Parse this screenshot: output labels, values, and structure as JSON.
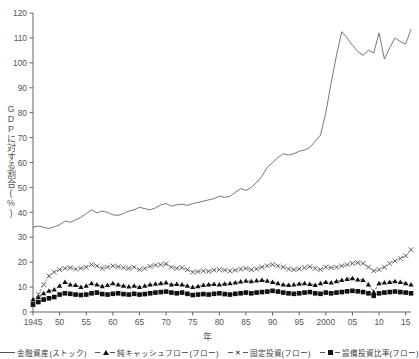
{
  "chart_data": {
    "type": "line",
    "title": "",
    "xlabel": "年",
    "ylabel": "GDPに対する割合(%)",
    "xlim": [
      1945,
      2016
    ],
    "ylim": [
      0,
      120
    ],
    "ytick_step": 10,
    "yticks": [
      0,
      10,
      20,
      30,
      40,
      50,
      60,
      70,
      80,
      90,
      100,
      110,
      120
    ],
    "xticks": [
      1945,
      1950,
      1955,
      1960,
      1965,
      1970,
      1975,
      1980,
      1985,
      1990,
      1995,
      2000,
      2005,
      2010,
      2015
    ],
    "xtick_labels": [
      "1945",
      "50",
      "55",
      "60",
      "65",
      "70",
      "75",
      "80",
      "85",
      "90",
      "95",
      "2000",
      "05",
      "10",
      "15"
    ],
    "grid": false,
    "legend_position": "bottom",
    "x": [
      1945,
      1946,
      1947,
      1948,
      1949,
      1950,
      1951,
      1952,
      1953,
      1954,
      1955,
      1956,
      1957,
      1958,
      1959,
      1960,
      1961,
      1962,
      1963,
      1964,
      1965,
      1966,
      1967,
      1968,
      1969,
      1970,
      1971,
      1972,
      1973,
      1974,
      1975,
      1976,
      1977,
      1978,
      1979,
      1980,
      1981,
      1982,
      1983,
      1984,
      1985,
      1986,
      1987,
      1988,
      1989,
      1990,
      1991,
      1992,
      1993,
      1994,
      1995,
      1996,
      1997,
      1998,
      1999,
      2000,
      2001,
      2002,
      2003,
      2004,
      2005,
      2006,
      2007,
      2008,
      2009,
      2010,
      2011,
      2012,
      2013,
      2014,
      2015,
      2016
    ],
    "series": [
      {
        "name": "金融資産(ストック)",
        "label": "金融資産(ストック)",
        "marker": "none",
        "linestyle": "solid",
        "color": "#555555",
        "values": [
          34.0,
          34.5,
          34.0,
          33.5,
          34.2,
          35.0,
          36.5,
          36.0,
          37.0,
          38.0,
          39.5,
          41.0,
          39.8,
          40.5,
          40.0,
          39.0,
          38.8,
          39.5,
          40.5,
          41.0,
          42.0,
          41.5,
          41.0,
          41.8,
          43.0,
          43.5,
          42.5,
          43.0,
          43.3,
          42.8,
          43.5,
          44.0,
          44.5,
          45.0,
          45.5,
          46.5,
          46.0,
          46.5,
          48.0,
          49.5,
          48.8,
          50.0,
          52.0,
          54.5,
          58.0,
          60.0,
          62.0,
          63.5,
          63.0,
          63.5,
          64.5,
          65.0,
          66.0,
          68.5,
          71.0,
          80.0,
          92.0,
          103.0,
          112.5,
          110.0,
          107.0,
          104.5,
          103.0,
          105.0,
          104.0,
          112.0,
          101.5,
          106.0,
          110.0,
          108.5,
          107.5,
          113.5
        ]
      },
      {
        "name": "純キャッシュフロー(フロー)",
        "label": "純キャッシュフロー(フロー)",
        "marker": "triangle",
        "linestyle": "dashed",
        "color": "#111111",
        "values": [
          5.0,
          6.0,
          7.5,
          8.5,
          9.0,
          10.5,
          12.0,
          11.0,
          10.8,
          10.0,
          10.5,
          11.5,
          11.0,
          10.3,
          10.8,
          11.5,
          11.0,
          10.5,
          10.2,
          10.5,
          10.0,
          10.5,
          11.0,
          11.3,
          11.5,
          11.8,
          11.0,
          11.2,
          11.0,
          10.5,
          10.0,
          10.3,
          10.8,
          11.0,
          11.2,
          11.0,
          11.3,
          11.5,
          11.8,
          12.2,
          12.5,
          12.3,
          12.6,
          12.8,
          12.5,
          12.0,
          11.5,
          11.0,
          10.8,
          11.0,
          11.3,
          11.5,
          11.2,
          10.8,
          11.5,
          12.0,
          11.8,
          12.3,
          12.8,
          13.2,
          13.5,
          13.0,
          12.8,
          11.0,
          8.0,
          11.5,
          11.8,
          12.0,
          12.3,
          12.0,
          11.5,
          11.0
        ]
      },
      {
        "name": "固定投資(フロー)",
        "label": "固定投資(フロー)",
        "marker": "x",
        "linestyle": "dashed",
        "color": "#555555",
        "values": [
          3.0,
          7.0,
          11.0,
          14.5,
          16.0,
          17.0,
          17.5,
          17.8,
          17.2,
          17.5,
          18.0,
          19.0,
          18.5,
          17.5,
          18.0,
          18.5,
          18.2,
          17.8,
          17.5,
          18.0,
          17.0,
          17.5,
          18.3,
          18.8,
          19.0,
          19.3,
          18.0,
          17.5,
          17.8,
          17.0,
          16.0,
          16.2,
          16.5,
          16.3,
          16.8,
          17.0,
          16.8,
          16.5,
          16.8,
          17.2,
          17.5,
          17.0,
          17.3,
          18.0,
          18.5,
          19.0,
          18.5,
          18.0,
          17.2,
          17.0,
          17.3,
          17.8,
          18.2,
          17.5,
          17.0,
          18.0,
          17.8,
          18.0,
          18.5,
          19.0,
          19.5,
          19.8,
          19.5,
          18.0,
          16.5,
          17.0,
          18.0,
          19.5,
          20.5,
          21.5,
          22.5,
          25.0
        ]
      },
      {
        "name": "設備投資比率(フロー)",
        "label": "設備投資比率(フロー)",
        "marker": "square",
        "linestyle": "dashed",
        "color": "#111111",
        "values": [
          3.0,
          4.0,
          5.0,
          5.5,
          6.0,
          7.0,
          7.5,
          7.3,
          7.0,
          6.8,
          7.0,
          7.5,
          7.8,
          7.2,
          7.0,
          7.3,
          7.5,
          7.2,
          7.0,
          7.3,
          7.0,
          7.2,
          7.5,
          7.8,
          8.0,
          8.2,
          7.8,
          7.5,
          7.8,
          7.3,
          6.8,
          7.0,
          7.2,
          7.0,
          7.3,
          7.5,
          7.2,
          7.0,
          7.3,
          7.5,
          7.8,
          7.5,
          7.8,
          8.0,
          8.2,
          8.5,
          8.2,
          7.8,
          7.5,
          7.3,
          7.5,
          7.8,
          8.0,
          7.5,
          7.3,
          7.8,
          7.5,
          7.8,
          8.0,
          8.3,
          8.5,
          8.3,
          8.0,
          7.5,
          6.5,
          7.5,
          7.8,
          8.0,
          8.2,
          8.0,
          7.8,
          7.5
        ]
      }
    ]
  },
  "legend": {
    "items": [
      {
        "label": "金融資産(ストック)",
        "marker": "none"
      },
      {
        "label": "純キャッシュフロー(フロー)",
        "marker": "triangle"
      },
      {
        "label": "固定投資(フロー)",
        "marker": "x"
      },
      {
        "label": "設備投資比率(フロー)",
        "marker": "square"
      }
    ]
  },
  "colors": {
    "axis": "#555555",
    "line_primary": "#555555",
    "marker_dark": "#111111",
    "background": "#ffffff"
  }
}
